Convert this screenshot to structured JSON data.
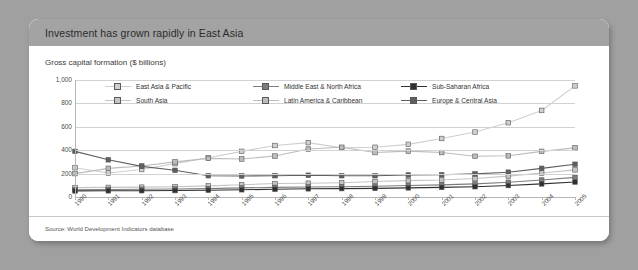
{
  "card": {
    "title": "Investment has grown rapidly in East Asia",
    "subtitle": "Gross capital formation ($ billions)",
    "source": "Source: World Development Indicators database"
  },
  "colors": {
    "background": "#a0a0a0",
    "card": "#ffffff",
    "header_bar": "#a3a3a3",
    "gridline": "#d2d2d2",
    "axis": "#b6b6b6"
  },
  "chart_data": {
    "type": "line",
    "title": "Investment has grown rapidly in East Asia",
    "subtitle": "Gross capital formation ($ billions)",
    "xlabel": "",
    "ylabel": "",
    "ylim": [
      0,
      1000
    ],
    "yticks": [
      "0",
      "200",
      "400",
      "600",
      "800",
      "1,000"
    ],
    "ytick_values": [
      0,
      200,
      400,
      600,
      800,
      1000
    ],
    "grid": true,
    "legend_position": "top-inside",
    "categories": [
      "1990",
      "1991",
      "1992",
      "1993",
      "1994",
      "1995",
      "1996",
      "1997",
      "1998",
      "1999",
      "2000",
      "2001",
      "2002",
      "2003",
      "2004",
      "2005"
    ],
    "series": [
      {
        "name": "East Asia & Pacific",
        "color": "#cfcfcf",
        "values": [
          250,
          205,
          235,
          285,
          335,
          390,
          440,
          465,
          420,
          425,
          450,
          500,
          555,
          635,
          740,
          950
        ]
      },
      {
        "name": "South Asia",
        "color": "#c4c4c4",
        "values": [
          80,
          82,
          84,
          88,
          95,
          105,
          115,
          118,
          122,
          132,
          140,
          145,
          158,
          178,
          205,
          232
        ]
      },
      {
        "name": "Middle East & North Africa",
        "color": "#7d7d7d",
        "values": [
          62,
          64,
          66,
          68,
          72,
          78,
          82,
          86,
          88,
          92,
          98,
          104,
          112,
          126,
          145,
          168
        ]
      },
      {
        "name": "Latin America & Caribbean",
        "color": "#bcbcbc",
        "values": [
          200,
          245,
          265,
          300,
          330,
          325,
          350,
          410,
          425,
          380,
          392,
          380,
          348,
          352,
          390,
          420
        ]
      },
      {
        "name": "Sub-Saharan Africa",
        "color": "#303030",
        "values": [
          52,
          53,
          54,
          55,
          58,
          62,
          66,
          70,
          72,
          74,
          78,
          82,
          88,
          98,
          112,
          128
        ]
      },
      {
        "name": "Europe & Central Asia",
        "color": "#5f5f5f",
        "values": [
          390,
          318,
          262,
          228,
          182,
          180,
          182,
          186,
          182,
          182,
          188,
          190,
          198,
          212,
          245,
          280
        ]
      }
    ]
  }
}
